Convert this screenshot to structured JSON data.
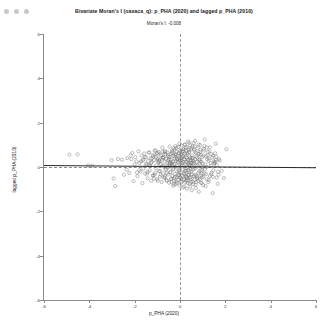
{
  "window": {
    "controls": [
      {
        "name": "close-dot",
        "color": "#c9c9c9"
      },
      {
        "name": "minimize-dot",
        "color": "#c9c9c9"
      },
      {
        "name": "maximize-dot",
        "color": "#c9c9c9"
      }
    ]
  },
  "chart_data": {
    "type": "scatter",
    "title": "Bivariate Moran's I (oaxaca_q): p_PHA (2020) and lagged p_PHA (2010)",
    "subtitle": "Moran's I: -0.008",
    "xlabel": "p_PHA (2020)",
    "ylabel": "lagged p_PHA (2010)",
    "xlim": [
      -6,
      6
    ],
    "ylim": [
      -6,
      6
    ],
    "xticks": [
      -6,
      -4,
      -2,
      0,
      2,
      4,
      6
    ],
    "yticks": [
      -6,
      -4,
      -2,
      0,
      2,
      4,
      6
    ],
    "xticklabels": [
      "-6",
      "-4",
      "-2",
      "0",
      "2",
      "4",
      "6"
    ],
    "yticklabels": [
      "-6",
      "-4",
      "-2",
      "0",
      "2",
      "4",
      "6"
    ],
    "grid": false,
    "legend": null,
    "morans_i": -0.008,
    "n_points": 570,
    "marker": {
      "shape": "circle-open",
      "color": "#6f6f6f",
      "size": 1.6
    },
    "reference_lines": [
      {
        "name": "vertical-mean-line",
        "orientation": "vertical",
        "value": 0,
        "style": "dashed",
        "color": "#9a9a9a"
      },
      {
        "name": "horizontal-mean-line",
        "orientation": "horizontal",
        "value": 0,
        "style": "dashed",
        "color": "#8a8a8a"
      }
    ],
    "regression_line": {
      "slope": -0.008,
      "intercept": 0.02,
      "color": "#2a2a2a",
      "style": "solid"
    },
    "points": [
      [
        -4.88,
        0.56
      ],
      [
        -4.52,
        0.57
      ],
      [
        -4.05,
        0.07
      ],
      [
        -3.87,
        0.06
      ],
      [
        -3.02,
        0.31
      ],
      [
        -2.93,
        -0.52
      ],
      [
        -2.86,
        -0.86
      ],
      [
        -2.74,
        0.36
      ],
      [
        -2.56,
        0.33
      ],
      [
        -2.47,
        -0.35
      ],
      [
        -2.33,
        0.4
      ],
      [
        -2.24,
        -0.27
      ],
      [
        -2.18,
        0.52
      ],
      [
        -2.1,
        0.63
      ],
      [
        -2.05,
        -0.64
      ],
      [
        -1.97,
        0.44
      ],
      [
        -1.92,
        0.25
      ],
      [
        -1.88,
        -0.41
      ],
      [
        -1.83,
        0.71
      ],
      [
        -1.79,
        0.18
      ],
      [
        -1.74,
        -0.22
      ],
      [
        -1.7,
        0.52
      ],
      [
        -1.66,
        -0.73
      ],
      [
        -1.62,
        0.33
      ],
      [
        -1.58,
        0.61
      ],
      [
        -1.54,
        -0.3
      ],
      [
        -1.5,
        0.44
      ],
      [
        -1.47,
        0.1
      ],
      [
        -1.43,
        -0.51
      ],
      [
        -1.4,
        0.27
      ],
      [
        -1.36,
        0.66
      ],
      [
        -1.33,
        -0.15
      ],
      [
        -1.3,
        0.39
      ],
      [
        -1.27,
        -0.62
      ],
      [
        -1.24,
        0.22
      ],
      [
        -1.21,
        0.54
      ],
      [
        -1.18,
        -0.37
      ],
      [
        -1.15,
        0.31
      ],
      [
        -1.12,
        0.73
      ],
      [
        -1.09,
        -0.26
      ],
      [
        -1.06,
        0.45
      ],
      [
        -1.04,
        0.08
      ],
      [
        -1.01,
        -0.55
      ],
      [
        -0.98,
        0.36
      ],
      [
        -0.96,
        0.62
      ],
      [
        -0.93,
        -0.19
      ],
      [
        -0.91,
        0.28
      ],
      [
        -0.88,
        -0.44
      ],
      [
        -0.86,
        0.51
      ],
      [
        -0.84,
        0.14
      ],
      [
        -0.81,
        -0.68
      ],
      [
        -0.79,
        0.33
      ],
      [
        -0.77,
        0.7
      ],
      [
        -0.75,
        -0.29
      ],
      [
        -0.73,
        0.41
      ],
      [
        -0.71,
        0.05
      ],
      [
        -0.69,
        -0.48
      ],
      [
        -0.67,
        0.24
      ],
      [
        -0.65,
        0.58
      ],
      [
        -0.63,
        -0.13
      ],
      [
        -0.61,
        0.37
      ],
      [
        -0.59,
        -0.59
      ],
      [
        -0.57,
        0.2
      ],
      [
        -0.55,
        0.66
      ],
      [
        -0.53,
        -0.34
      ],
      [
        -0.52,
        0.29
      ],
      [
        -0.5,
        0.02
      ],
      [
        -0.48,
        -0.71
      ],
      [
        -0.46,
        0.46
      ],
      [
        -0.45,
        0.11
      ],
      [
        -0.43,
        -0.24
      ],
      [
        -0.41,
        0.6
      ],
      [
        -0.4,
        0.32
      ],
      [
        -0.38,
        -0.52
      ],
      [
        -0.37,
        0.17
      ],
      [
        -0.35,
        0.74
      ],
      [
        -0.34,
        -0.4
      ],
      [
        -0.32,
        0.25
      ],
      [
        -0.31,
        -0.07
      ],
      [
        -0.29,
        0.49
      ],
      [
        -0.28,
        0.85
      ],
      [
        -0.27,
        -0.62
      ],
      [
        -0.25,
        0.13
      ],
      [
        -0.24,
        0.38
      ],
      [
        -0.23,
        -0.31
      ],
      [
        -0.21,
        0.55
      ],
      [
        -0.2,
        0.0
      ],
      [
        -0.19,
        -0.77
      ],
      [
        -0.18,
        0.27
      ],
      [
        -0.16,
        0.68
      ],
      [
        -0.15,
        -0.45
      ],
      [
        -0.14,
        0.34
      ],
      [
        -0.13,
        0.06
      ],
      [
        -0.12,
        -0.2
      ],
      [
        -0.11,
        0.52
      ],
      [
        -0.09,
        0.9
      ],
      [
        -0.08,
        -0.58
      ],
      [
        -0.07,
        0.21
      ],
      [
        -0.06,
        0.43
      ],
      [
        -0.05,
        -0.36
      ],
      [
        -0.04,
        0.63
      ],
      [
        -0.03,
        -0.04
      ],
      [
        -0.02,
        -0.84
      ],
      [
        -0.01,
        0.3
      ],
      [
        0.0,
        0.72
      ],
      [
        0.01,
        -0.49
      ],
      [
        0.02,
        0.39
      ],
      [
        0.03,
        0.09
      ],
      [
        0.04,
        -0.26
      ],
      [
        0.05,
        0.57
      ],
      [
        0.06,
        0.97
      ],
      [
        0.07,
        -0.65
      ],
      [
        0.08,
        0.16
      ],
      [
        0.09,
        0.47
      ],
      [
        0.1,
        -0.39
      ],
      [
        0.11,
        0.7
      ],
      [
        0.12,
        -0.11
      ],
      [
        0.13,
        -0.92
      ],
      [
        0.14,
        0.24
      ],
      [
        0.15,
        0.8
      ],
      [
        0.17,
        -0.54
      ],
      [
        0.18,
        0.35
      ],
      [
        0.19,
        0.03
      ],
      [
        0.2,
        -0.3
      ],
      [
        0.21,
        0.61
      ],
      [
        0.22,
        1.02
      ],
      [
        0.23,
        -0.7
      ],
      [
        0.24,
        0.12
      ],
      [
        0.26,
        0.44
      ],
      [
        0.27,
        -0.43
      ],
      [
        0.28,
        0.75
      ],
      [
        0.29,
        -0.17
      ],
      [
        0.3,
        -0.98
      ],
      [
        0.32,
        0.22
      ],
      [
        0.33,
        0.88
      ],
      [
        0.34,
        -0.6
      ],
      [
        0.36,
        0.31
      ],
      [
        0.37,
        -0.02
      ],
      [
        0.38,
        -0.35
      ],
      [
        0.4,
        0.66
      ],
      [
        0.41,
        1.1
      ],
      [
        0.43,
        -0.75
      ],
      [
        0.44,
        0.08
      ],
      [
        0.46,
        0.41
      ],
      [
        0.47,
        -0.47
      ],
      [
        0.49,
        0.79
      ],
      [
        0.5,
        -0.22
      ],
      [
        0.52,
        -1.05
      ],
      [
        0.54,
        0.18
      ],
      [
        0.55,
        0.93
      ],
      [
        0.57,
        -0.66
      ],
      [
        0.59,
        0.28
      ],
      [
        0.61,
        -0.08
      ],
      [
        0.63,
        -0.4
      ],
      [
        0.65,
        0.7
      ],
      [
        0.67,
        1.18
      ],
      [
        0.69,
        -0.8
      ],
      [
        0.71,
        0.04
      ],
      [
        0.73,
        0.48
      ],
      [
        0.76,
        -0.52
      ],
      [
        0.78,
        0.84
      ],
      [
        0.81,
        -0.28
      ],
      [
        0.83,
        -1.12
      ],
      [
        0.86,
        0.14
      ],
      [
        0.89,
        0.99
      ],
      [
        0.92,
        -0.71
      ],
      [
        0.95,
        0.24
      ],
      [
        0.98,
        -0.13
      ],
      [
        1.02,
        -0.45
      ],
      [
        1.05,
        0.74
      ],
      [
        1.09,
        1.24
      ],
      [
        1.13,
        -0.86
      ],
      [
        1.17,
        0.0
      ],
      [
        1.22,
        0.53
      ],
      [
        1.27,
        -0.58
      ],
      [
        1.32,
        0.89
      ],
      [
        1.38,
        -0.33
      ],
      [
        1.44,
        -1.18
      ],
      [
        1.51,
        0.19
      ],
      [
        1.58,
        1.05
      ],
      [
        1.66,
        -0.76
      ],
      [
        1.75,
        0.29
      ],
      [
        1.84,
        -0.18
      ],
      [
        1.94,
        -0.5
      ],
      [
        2.05,
        0.8
      ],
      [
        0.45,
        -0.05
      ],
      [
        0.12,
        0.5
      ],
      [
        -0.3,
        -0.1
      ],
      [
        0.62,
        0.2
      ],
      [
        -0.55,
        0.05
      ],
      [
        0.95,
        -0.3
      ],
      [
        0.25,
        -0.15
      ],
      [
        -0.75,
        0.42
      ],
      [
        1.2,
        0.35
      ],
      [
        0.05,
        -0.7
      ],
      [
        -1.05,
        -0.05
      ],
      [
        0.8,
        0.6
      ],
      [
        -0.2,
        0.95
      ],
      [
        1.4,
        -0.25
      ],
      [
        0.35,
        1.15
      ],
      [
        -1.5,
        0.15
      ],
      [
        0.7,
        -0.95
      ],
      [
        -0.1,
        0.25
      ],
      [
        1.6,
        0.45
      ],
      [
        0.5,
        0.05
      ],
      [
        -0.4,
        -0.55
      ],
      [
        0.15,
        0.8
      ],
      [
        -0.85,
        -0.35
      ],
      [
        1.0,
        0.15
      ],
      [
        0.3,
        -0.45
      ],
      [
        -0.65,
        0.68
      ],
      [
        0.88,
        -0.55
      ],
      [
        -0.05,
        -0.25
      ],
      [
        1.3,
        0.7
      ],
      [
        0.42,
        0.48
      ],
      [
        -1.2,
        -0.4
      ],
      [
        0.58,
        -0.78
      ],
      [
        -0.35,
        0.62
      ],
      [
        1.1,
        -0.1
      ],
      [
        0.2,
        0.35
      ],
      [
        -0.95,
        0.22
      ],
      [
        0.66,
        0.92
      ],
      [
        -0.15,
        -0.65
      ],
      [
        1.5,
        0.25
      ],
      [
        0.38,
        -0.35
      ],
      [
        -0.5,
        0.45
      ],
      [
        0.92,
        0.55
      ],
      [
        0.02,
        0.65
      ],
      [
        -1.35,
        0.08
      ],
      [
        0.74,
        -0.42
      ],
      [
        -0.25,
        0.78
      ],
      [
        1.7,
        -0.35
      ],
      [
        0.48,
        0.28
      ],
      [
        -0.7,
        -0.48
      ],
      [
        0.18,
        -0.88
      ],
      [
        -1.1,
        0.52
      ],
      [
        1.05,
        0.82
      ],
      [
        0.28,
        -0.62
      ],
      [
        -0.45,
        0.18
      ],
      [
        0.84,
        -0.2
      ],
      [
        -0.02,
        1.05
      ],
      [
        1.25,
        -0.68
      ],
      [
        0.55,
        0.38
      ],
      [
        -1.65,
        0.3
      ],
      [
        0.68,
        -0.05
      ],
      [
        -0.28,
        -0.78
      ],
      [
        1.15,
        0.48
      ],
      [
        0.4,
        0.68
      ],
      [
        -0.88,
        -0.18
      ],
      [
        0.96,
        -0.48
      ],
      [
        0.08,
        0.42
      ],
      [
        -1.42,
        -0.22
      ],
      [
        0.6,
        1.08
      ],
      [
        -0.58,
        -0.28
      ],
      [
        1.35,
        0.18
      ],
      [
        0.32,
        -0.52
      ],
      [
        -0.18,
        0.58
      ],
      [
        0.78,
        0.08
      ],
      [
        -1.25,
        0.38
      ],
      [
        1.45,
        -0.45
      ],
      [
        0.52,
        -0.32
      ],
      [
        -0.78,
        0.88
      ],
      [
        0.22,
        -0.18
      ],
      [
        -2.0,
        0.12
      ],
      [
        1.55,
        0.62
      ],
      [
        0.45,
        0.98
      ],
      [
        -0.38,
        -0.68
      ],
      [
        0.86,
        0.32
      ],
      [
        -0.08,
        -0.38
      ],
      [
        1.18,
        0.88
      ],
      [
        0.64,
        -0.58
      ],
      [
        -1.02,
        0.62
      ],
      [
        0.14,
        0.72
      ],
      [
        -0.62,
        -0.08
      ],
      [
        0.98,
        0.02
      ],
      [
        1.62,
        0.08
      ],
      [
        0.36,
        0.15
      ],
      [
        -0.48,
        0.35
      ],
      [
        0.72,
        -0.68
      ],
      [
        -1.8,
        -0.15
      ],
      [
        1.08,
        -0.28
      ],
      [
        0.26,
        0.88
      ],
      [
        -0.32,
        0.08
      ],
      [
        0.9,
        0.68
      ],
      [
        -1.15,
        -0.52
      ],
      [
        0.44,
        -0.88
      ],
      [
        0.1,
        0.18
      ],
      [
        -0.68,
        0.72
      ],
      [
        1.28,
        0.38
      ],
      [
        0.56,
        -0.12
      ],
      [
        -0.22,
        -0.45
      ],
      [
        0.82,
        1.02
      ],
      [
        -1.55,
        0.45
      ],
      [
        1.48,
        -0.15
      ],
      [
        0.34,
        -0.72
      ],
      [
        -0.52,
        0.52
      ],
      [
        0.94,
        -0.38
      ],
      [
        0.06,
        -0.52
      ],
      [
        -0.92,
        0.32
      ],
      [
        1.38,
        0.58
      ],
      [
        0.62,
        0.78
      ],
      [
        -0.42,
        -0.22
      ],
      [
        0.24,
        0.58
      ],
      [
        -1.28,
        0.18
      ],
      [
        1.02,
        -0.82
      ],
      [
        0.48,
        0.18
      ],
      [
        -0.12,
        0.38
      ],
      [
        0.76,
        0.42
      ],
      [
        -2.35,
        -0.12
      ],
      [
        1.58,
        0.32
      ],
      [
        0.3,
        0.42
      ],
      [
        -0.58,
        -0.62
      ],
      [
        0.88,
        0.25
      ],
      [
        -0.82,
        0.55
      ],
      [
        1.12,
        0.12
      ],
      [
        0.42,
        -0.25
      ],
      [
        -0.16,
        0.85
      ],
      [
        0.68,
        -0.35
      ],
      [
        -1.45,
        -0.3
      ],
      [
        1.22,
        0.68
      ],
      [
        0.54,
        0.52
      ],
      [
        -0.36,
        0.12
      ],
      [
        0.16,
        -0.32
      ],
      [
        -1.08,
        0.75
      ],
      [
        0.99,
        0.45
      ],
      [
        1.68,
        -0.22
      ],
      [
        0.38,
        0.78
      ],
      [
        -0.72,
        0.02
      ],
      [
        0.8,
        -0.62
      ],
      [
        -0.26,
        -0.52
      ],
      [
        1.32,
        -0.4
      ],
      [
        0.58,
        0.15
      ],
      [
        -0.98,
        -0.62
      ],
      [
        0.2,
        1.0
      ],
      [
        -1.72,
        0.25
      ],
      [
        1.42,
        0.42
      ],
      [
        0.46,
        -0.55
      ],
      [
        -0.46,
        0.92
      ],
      [
        0.92,
        -0.15
      ],
      [
        0.04,
        0.28
      ],
      [
        -1.18,
        0.48
      ],
      [
        1.52,
        0.15
      ],
      [
        0.66,
        0.35
      ],
      [
        -0.66,
        -0.42
      ],
      [
        0.28,
        0.22
      ],
      [
        -2.15,
        0.35
      ],
      [
        1.08,
        0.95
      ],
      [
        0.5,
        -0.68
      ],
      [
        -0.05,
        -0.15
      ],
      [
        0.84,
        0.58
      ],
      [
        -1.38,
        0.65
      ],
      [
        1.18,
        -0.55
      ],
      [
        0.32,
        0.62
      ],
      [
        -0.54,
        -0.02
      ],
      [
        0.74,
        0.22
      ],
      [
        -0.88,
        0.12
      ],
      [
        1.62,
        -0.48
      ],
      [
        0.4,
        0.08
      ],
      [
        -0.24,
        0.48
      ],
      [
        0.96,
        -0.72
      ],
      [
        -1.62,
        -0.08
      ],
      [
        1.26,
        0.28
      ],
      [
        0.6,
        -0.42
      ],
      [
        -0.34,
        0.68
      ],
      [
        0.18,
        -0.58
      ],
      [
        -1.0,
        0.28
      ],
      [
        1.04,
        0.52
      ],
      [
        1.72,
        0.35
      ],
      [
        0.44,
        0.32
      ],
      [
        -0.64,
        0.58
      ],
      [
        0.78,
        -0.48
      ],
      [
        -0.14,
        -0.72
      ],
      [
        1.36,
        0.05
      ],
      [
        0.52,
        0.85
      ],
      [
        -1.9,
        -0.25
      ],
      [
        0.24,
        -0.38
      ],
      [
        -0.42,
        0.22
      ],
      [
        0.9,
        0.78
      ],
      [
        -1.12,
        -0.35
      ],
      [
        1.46,
        0.52
      ],
      [
        0.36,
        -0.15
      ],
      [
        -0.76,
        0.42
      ],
      [
        0.7,
        0.65
      ],
      [
        0.0,
        -0.45
      ],
      [
        -1.32,
        0.05
      ],
      [
        1.14,
        -0.32
      ],
      [
        0.56,
        0.42
      ],
      [
        -0.3,
        -0.85
      ],
      [
        0.86,
        0.35
      ],
      [
        -0.94,
        0.68
      ],
      [
        1.56,
        0.22
      ],
      [
        0.42,
        -0.48
      ]
    ]
  }
}
